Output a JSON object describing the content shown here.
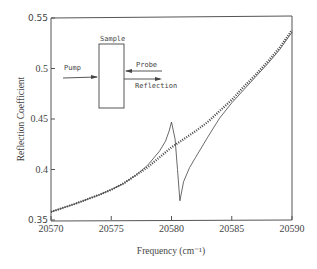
{
  "chart_data": {
    "type": "line",
    "title": "",
    "xlabel": "Frequency (cm⁻¹)",
    "ylabel": "Reflection Coefficient",
    "xlim": [
      20570,
      20590
    ],
    "ylim": [
      0.35,
      0.55
    ],
    "x_ticks": [
      20570,
      20575,
      20580,
      20585,
      20590
    ],
    "y_ticks": [
      0.35,
      0.4,
      0.45,
      0.5,
      0.55
    ],
    "x_tick_labels": [
      "20570",
      "20575",
      "20580",
      "20585",
      "20590"
    ],
    "y_tick_labels": [
      "0.35",
      "0.4",
      "0.45",
      "0.5",
      "0.55"
    ],
    "grid": false,
    "legend": null,
    "series": [
      {
        "name": "without pump (dotted)",
        "style": "dotted",
        "x": [
          20570,
          20572,
          20574,
          20575,
          20576,
          20578,
          20579,
          20580,
          20581,
          20582,
          20583,
          20584,
          20585,
          20586,
          20587,
          20588,
          20589,
          20590
        ],
        "y": [
          0.358,
          0.366,
          0.375,
          0.38,
          0.386,
          0.402,
          0.412,
          0.422,
          0.43,
          0.438,
          0.447,
          0.458,
          0.469,
          0.482,
          0.494,
          0.507,
          0.521,
          0.538
        ]
      },
      {
        "name": "with pump (solid)",
        "style": "solid",
        "x": [
          20570,
          20572,
          20574,
          20575,
          20576,
          20577,
          20578,
          20579,
          20579.5,
          20579.8,
          20580,
          20580.3,
          20580.5,
          20580.7,
          20581,
          20581.5,
          20582,
          20583,
          20584,
          20585,
          20586,
          20587,
          20588,
          20589,
          20590
        ],
        "y": [
          0.358,
          0.366,
          0.375,
          0.38,
          0.386,
          0.394,
          0.404,
          0.418,
          0.428,
          0.438,
          0.447,
          0.43,
          0.4,
          0.369,
          0.388,
          0.402,
          0.412,
          0.432,
          0.451,
          0.466,
          0.479,
          0.492,
          0.505,
          0.519,
          0.536
        ]
      }
    ],
    "annotations": {
      "inset_labels": [
        "Sample",
        "Pump",
        "Probe",
        "Reflection"
      ]
    }
  },
  "inset": {
    "sample_label": "Sample",
    "pump_label": "Pump",
    "probe_label": "Probe",
    "reflection_label": "Reflection"
  },
  "colors": {
    "axis": "#555555",
    "line": "#444444",
    "background": "#ffffff"
  }
}
